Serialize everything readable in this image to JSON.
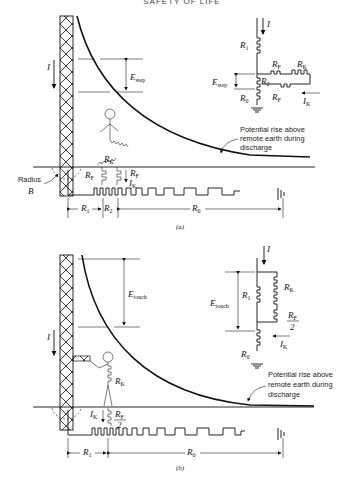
{
  "header": {
    "running_head": "SAFETY OF LIFE"
  },
  "figure_a": {
    "caption": "(a)",
    "current_label": "I",
    "voltage_label": "E",
    "voltage_sub": "step",
    "radius_label_1": "Radius",
    "radius_label_2": "B",
    "curve_annotation": [
      "Potential rise above",
      "remote earth during",
      "discharge"
    ],
    "ground_labels": {
      "r1": "R",
      "r1_sub": "1",
      "r2": "R",
      "r2_sub": "2",
      "r0": "R",
      "r0_sub": "0"
    },
    "body_labels": {
      "rk": "R",
      "rk_sub": "K",
      "rf_left": "R",
      "rf_left_sub": "F",
      "rf_right": "R",
      "rf_right_sub": "F",
      "ik": "I",
      "ik_sub": "K"
    },
    "circuit": {
      "current": "I",
      "r1": "R",
      "r1_sub": "1",
      "r2": "R",
      "r2_sub": "2",
      "r0": "R",
      "r0_sub": "0",
      "rf_top": "R",
      "rf_top_sub": "F",
      "rk": "R",
      "rk_sub": "K",
      "rf_bottom": "R",
      "rf_bottom_sub": "F",
      "e": "E",
      "e_sub": "step",
      "ik": "I",
      "ik_sub": "K"
    }
  },
  "figure_b": {
    "caption": "(b)",
    "current_label": "I",
    "voltage_label": "E",
    "voltage_sub": "touch",
    "curve_annotation": [
      "Potential rise above",
      "remote earth during",
      "discharge"
    ],
    "ground_labels": {
      "r1": "R",
      "r1_sub": "1",
      "r0": "R",
      "r0_sub": "0"
    },
    "body_labels": {
      "rk": "R",
      "rk_sub": "K",
      "ik": "I",
      "ik_sub": "K",
      "rf": "R",
      "rf_sub": "F",
      "rf_den": "2"
    },
    "circuit": {
      "current": "I",
      "r1": "R",
      "r1_sub": "1",
      "rk": "R",
      "rk_sub": "K",
      "rf": "R",
      "rf_sub": "F",
      "rf_den": "2",
      "r0": "R",
      "r0_sub": "0",
      "e": "E",
      "e_sub": "touch",
      "ik": "I",
      "ik_sub": "K"
    }
  }
}
